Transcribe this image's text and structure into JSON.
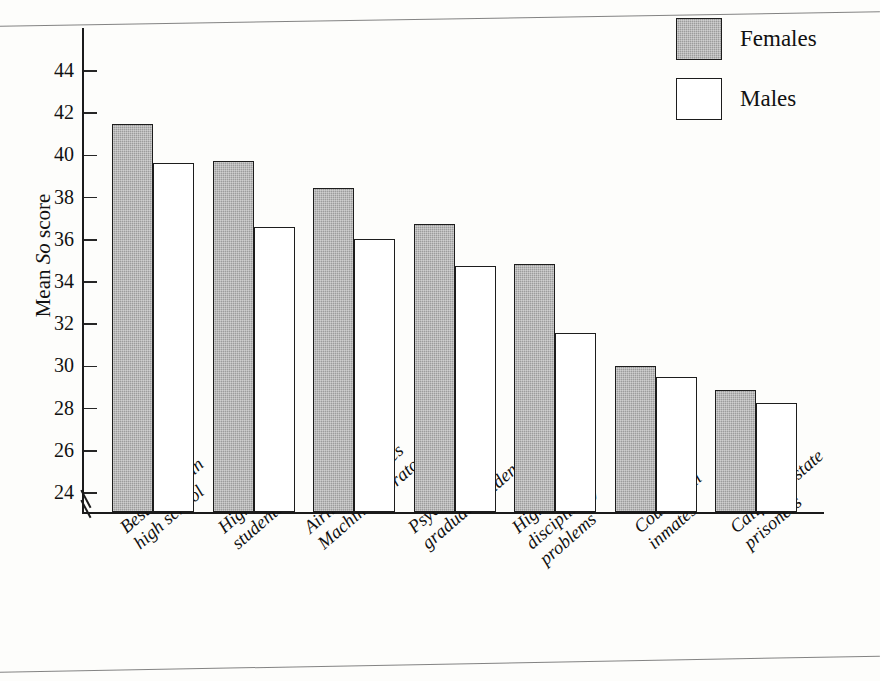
{
  "chart_data": {
    "type": "bar",
    "title": "",
    "subtitle": "",
    "xlabel": "",
    "ylabel": "Mean So score",
    "ylabel_italic_part": "So",
    "ylim": [
      23.2,
      45.2
    ],
    "yticks": [
      24,
      26,
      28,
      30,
      32,
      34,
      36,
      38,
      40,
      42,
      44
    ],
    "ytick_labels": [
      "24",
      "26",
      "28",
      "30",
      "32",
      "34",
      "36",
      "38",
      "40",
      "42",
      "44"
    ],
    "axis_break": true,
    "axis_break_note": "zig-zag break on y-axis below 24",
    "grid": false,
    "legend_position": "top-right",
    "categories": [
      "Best citizen in\nhigh school",
      "High school\nstudents",
      "Airline hostesses\nMachine operators",
      "Psychology\ngraduate students",
      "High school\ndisciplinary\nproblems",
      "County jail\ninmates",
      "California state\nprisoners"
    ],
    "category_lines": [
      [
        "Best citizen in",
        "high school"
      ],
      [
        "High school",
        "students"
      ],
      [
        "Airline hostesses",
        "Machine operators"
      ],
      [
        "Psychology",
        "graduate students"
      ],
      [
        "High school",
        "disciplinary",
        "problems"
      ],
      [
        "County jail",
        "inmates"
      ],
      [
        "California state",
        "prisoners"
      ]
    ],
    "series": [
      {
        "name": "Females",
        "color": "#9c9c9c",
        "fill": "shaded",
        "values": [
          41.5,
          39.75,
          38.45,
          36.75,
          34.85,
          30.0,
          28.9
        ]
      },
      {
        "name": "Males",
        "color": "#ffffff",
        "fill": "open",
        "values": [
          39.65,
          36.6,
          36.05,
          34.75,
          31.6,
          29.5,
          28.25
        ]
      }
    ]
  },
  "legend": {
    "items": [
      {
        "label": "Females",
        "swatch": "shaded"
      },
      {
        "label": "Males",
        "swatch": "open"
      }
    ]
  },
  "axis": {
    "y_label_prefix": "Mean ",
    "y_label_italic": "So",
    "y_label_suffix": " score"
  }
}
